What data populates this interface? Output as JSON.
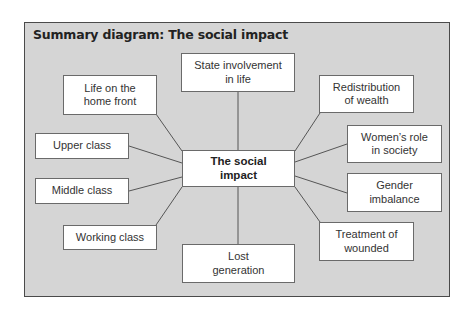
{
  "diagram": {
    "title": "Summary diagram: The social impact",
    "center": {
      "line1": "The social",
      "line2": "impact"
    },
    "nodes": [
      {
        "id": "state-involvement",
        "line1": "State involvement",
        "line2": "in life"
      },
      {
        "id": "life-home-front",
        "line1": "Life on the",
        "line2": "home front"
      },
      {
        "id": "redistribution-wealth",
        "line1": "Redistribution",
        "line2": "of wealth"
      },
      {
        "id": "upper-class",
        "line1": "Upper class",
        "line2": ""
      },
      {
        "id": "womens-role",
        "line1": "Women’s role",
        "line2": "in society"
      },
      {
        "id": "middle-class",
        "line1": "Middle class",
        "line2": ""
      },
      {
        "id": "gender-imbalance",
        "line1": "Gender",
        "line2": "imbalance"
      },
      {
        "id": "working-class",
        "line1": "Working class",
        "line2": ""
      },
      {
        "id": "treatment-wounded",
        "line1": "Treatment of",
        "line2": "wounded"
      },
      {
        "id": "lost-generation",
        "line1": "Lost",
        "line2": "generation"
      }
    ],
    "colors": {
      "frame_fill": "#d5d5d5",
      "frame_border": "#4a4a4a",
      "node_fill": "#ffffff",
      "node_border": "#6a6a6a",
      "connector": "#555555"
    }
  }
}
